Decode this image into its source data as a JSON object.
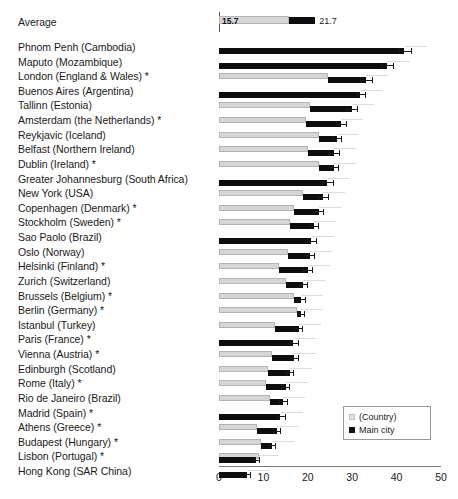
{
  "chart_data": {
    "type": "bar",
    "orientation": "horizontal",
    "title": "",
    "xlabel": "",
    "ylabel": "",
    "xlim": [
      0,
      50
    ],
    "xticks": [
      0,
      10,
      20,
      30,
      40,
      50
    ],
    "grid": false,
    "legend": {
      "position": "bottom-right",
      "entries": [
        {
          "label": "(Country)",
          "color": "#e0e0e0",
          "marker": "square"
        },
        {
          "label": "Main city",
          "color": "#111111",
          "marker": "square"
        }
      ]
    },
    "series": [
      {
        "name": "(Country)",
        "color": "#d6d6d6"
      },
      {
        "name": "Main city",
        "color": "#0d0d0d"
      }
    ],
    "average_row": {
      "label": "Average",
      "country_value": 15.7,
      "country_value_text": "15.7",
      "city_value": 21.7,
      "city_value_text": "21.7"
    },
    "categories": [
      "Phnom Penh (Cambodia)",
      "Maputo (Mozambique)",
      "London (England & Wales) *",
      "Buenos Aires (Argentina)",
      "Tallinn (Estonia)",
      "Amsterdam (the Netherlands) *",
      "Reykjavic (Iceland)",
      "Belfast (Northern Ireland)",
      "Dublin (Ireland) *",
      "Greater Johannesburg (South Africa)",
      "New York (USA)",
      "Copenhagen (Denmark) *",
      "Stockholm (Sweden) *",
      "Sao Paolo (Brazil)",
      "Oslo (Norway)",
      "Helsinki (Finland) *",
      "Zurich (Switzerland)",
      "Brussels (Belgium) *",
      "Berlin (Germany) *",
      "Istanbul (Turkey)",
      "Paris (France) *",
      "Vienna (Austria) *",
      "Edinburgh (Scotland)",
      "Rome (Italy) *",
      "Rio de Janeiro (Brazil)",
      "Madrid (Spain) *",
      "Athens (Greece) *",
      "Budapest (Hungary) *",
      "Lisbon (Portugal) *",
      "Hong Kong (SAR China)"
    ],
    "rows": [
      {
        "label": "Phnom Penh (Cambodia)",
        "country": null,
        "city": 42.0,
        "ci_low": 40.5,
        "ci_high": 43.5
      },
      {
        "label": "Maputo (Mozambique)",
        "country": null,
        "city": 38.0,
        "ci_low": 36.5,
        "ci_high": 39.5
      },
      {
        "label": "London (England & Wales) *",
        "country": 24.5,
        "city": 33.0,
        "ci_low": 31.8,
        "ci_high": 34.6
      },
      {
        "label": "Buenos Aires (Argentina)",
        "country": null,
        "city": 32.0,
        "ci_low": 31.0,
        "ci_high": 33.2
      },
      {
        "label": "Tallinn (Estonia)",
        "country": 20.5,
        "city": 30.0,
        "ci_low": 28.6,
        "ci_high": 31.4
      },
      {
        "label": "Amsterdam (the Netherlands) *",
        "country": 19.5,
        "city": 27.5,
        "ci_low": 26.3,
        "ci_high": 28.8
      },
      {
        "label": "Reykjavic (Iceland)",
        "country": 22.5,
        "city": 26.5,
        "ci_low": 25.4,
        "ci_high": 27.8
      },
      {
        "label": "Belfast (Northern Ireland)",
        "country": 20.0,
        "city": 26.0,
        "ci_low": 24.8,
        "ci_high": 27.2
      },
      {
        "label": "Dublin (Ireland) *",
        "country": 22.5,
        "city": 26.0,
        "ci_low": 24.9,
        "ci_high": 27.1
      },
      {
        "label": "Greater Johannesburg (South Africa)",
        "country": null,
        "city": 24.5,
        "ci_low": 23.2,
        "ci_high": 25.8
      },
      {
        "label": "New York (USA)",
        "country": 19.0,
        "city": 23.5,
        "ci_low": 22.3,
        "ci_high": 24.7
      },
      {
        "label": "Copenhagen (Denmark) *",
        "country": 17.0,
        "city": 22.5,
        "ci_low": 21.3,
        "ci_high": 23.6
      },
      {
        "label": "Stockholm (Sweden) *",
        "country": 16.0,
        "city": 21.5,
        "ci_low": 20.4,
        "ci_high": 22.6
      },
      {
        "label": "Sao Paolo (Brazil)",
        "country": null,
        "city": 21.0,
        "ci_low": 19.9,
        "ci_high": 22.1
      },
      {
        "label": "Oslo (Norway)",
        "country": 15.5,
        "city": 20.5,
        "ci_low": 19.5,
        "ci_high": 21.6
      },
      {
        "label": "Helsinki (Finland) *",
        "country": 13.5,
        "city": 20.0,
        "ci_low": 18.9,
        "ci_high": 21.1
      },
      {
        "label": "Zurich (Switzerland)",
        "country": 15.0,
        "city": 19.0,
        "ci_low": 18.0,
        "ci_high": 20.1
      },
      {
        "label": "Brussels (Belgium) *",
        "country": 17.0,
        "city": 18.5,
        "ci_low": 17.5,
        "ci_high": 19.6
      },
      {
        "label": "Berlin (Germany) *",
        "country": 17.5,
        "city": 18.5,
        "ci_low": 17.6,
        "ci_high": 19.4
      },
      {
        "label": "Istanbul (Turkey)",
        "country": 12.5,
        "city": 18.0,
        "ci_low": 17.0,
        "ci_high": 19.0
      },
      {
        "label": "Paris (France) *",
        "country": null,
        "city": 17.0,
        "ci_low": 16.1,
        "ci_high": 18.0
      },
      {
        "label": "Vienna (Austria) *",
        "country": 12.0,
        "city": 17.0,
        "ci_low": 16.0,
        "ci_high": 18.0
      },
      {
        "label": "Edinburgh (Scotland)",
        "country": 11.0,
        "city": 16.0,
        "ci_low": 15.0,
        "ci_high": 17.0
      },
      {
        "label": "Rome (Italy) *",
        "country": 10.5,
        "city": 15.0,
        "ci_low": 14.0,
        "ci_high": 16.0
      },
      {
        "label": "Rio de Janeiro (Brazil)",
        "country": 11.5,
        "city": 14.5,
        "ci_low": 13.6,
        "ci_high": 15.5
      },
      {
        "label": "Madrid (Spain) *",
        "country": null,
        "city": 14.0,
        "ci_low": 13.1,
        "ci_high": 15.0
      },
      {
        "label": "Athens (Greece) *",
        "country": 8.5,
        "city": 13.0,
        "ci_low": 12.1,
        "ci_high": 13.9
      },
      {
        "label": "Budapest (Hungary) *",
        "country": 9.5,
        "city": 12.0,
        "ci_low": 11.2,
        "ci_high": 12.9
      },
      {
        "label": "Lisbon (Portugal) *",
        "country": 9.0,
        "city": 8.5,
        "ci_low": 7.8,
        "ci_high": 9.3
      },
      {
        "label": "Hong Kong (SAR China)",
        "country": null,
        "city": 6.5,
        "ci_low": 5.9,
        "ci_high": 7.2
      }
    ]
  }
}
